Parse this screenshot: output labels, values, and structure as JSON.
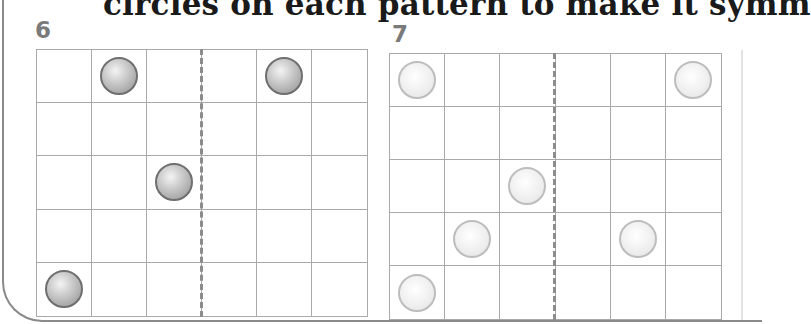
{
  "header": {
    "instruction_text": "circles on each pattern to make it symm"
  },
  "puzzles": [
    {
      "number": "6",
      "rows": 5,
      "cols": 6,
      "symmetry_line": "vertical, between column 3 and 4",
      "circle_style": "dark",
      "circles": [
        {
          "row": 0,
          "col": 1
        },
        {
          "row": 0,
          "col": 4
        },
        {
          "row": 2,
          "col": 2
        },
        {
          "row": 4,
          "col": 0
        }
      ]
    },
    {
      "number": "7",
      "rows": 5,
      "cols": 6,
      "symmetry_line": "vertical, between column 3 and 4",
      "circle_style": "light",
      "circles": [
        {
          "row": 0,
          "col": 0
        },
        {
          "row": 0,
          "col": 5
        },
        {
          "row": 2,
          "col": 2
        },
        {
          "row": 3,
          "col": 1
        },
        {
          "row": 3,
          "col": 4
        },
        {
          "row": 4,
          "col": 0
        }
      ]
    }
  ],
  "colors": {
    "grid_line": "#a9a9a9",
    "axis_line": "#8c8c8c",
    "number_label": "#7a7a7a",
    "dark_circle_border": "#6f6f6f",
    "light_circle_border": "#bdbdbd"
  }
}
